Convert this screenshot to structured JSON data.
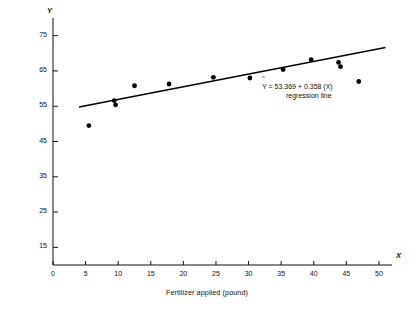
{
  "chart_data": {
    "type": "scatter",
    "title": "",
    "xlabel": "Fertilizer applied (pound)",
    "ylabel": "Yield of Maize (bushels)",
    "x_axis_letter": "X",
    "y_axis_letter": "Y",
    "xlim": [
      0,
      52
    ],
    "ylim": [
      10,
      80
    ],
    "xticks": [
      0,
      5,
      10,
      15,
      20,
      25,
      30,
      35,
      40,
      45,
      50
    ],
    "xtick_labels": [
      "0",
      "5",
      "10",
      "15",
      "20",
      "25",
      "30",
      "35",
      "40",
      "45",
      "50"
    ],
    "yticks": [
      15,
      25,
      35,
      45,
      55,
      65,
      75
    ],
    "ytick_labels": [
      "15",
      "25",
      "35",
      "45",
      "55",
      "65",
      "75"
    ],
    "grid": false,
    "legend": "none",
    "marker_color": "#000000",
    "line_color": "#000000",
    "points": [
      {
        "x": 5.5,
        "y": 49.5
      },
      {
        "x": 9.4,
        "y": 56.6
      },
      {
        "x": 9.6,
        "y": 55.4
      },
      {
        "x": 12.5,
        "y": 60.8
      },
      {
        "x": 17.8,
        "y": 61.3
      },
      {
        "x": 24.6,
        "y": 63.2
      },
      {
        "x": 30.2,
        "y": 63.0
      },
      {
        "x": 35.3,
        "y": 65.4
      },
      {
        "x": 39.6,
        "y": 68.2
      },
      {
        "x": 43.8,
        "y": 67.4
      },
      {
        "x": 44.1,
        "y": 66.2
      },
      {
        "x": 46.9,
        "y": 62.0
      }
    ],
    "regression": {
      "intercept": 53.369,
      "slope": 0.358,
      "x_start": 4.0,
      "x_end": 51.0,
      "equation_hat": "^",
      "equation": "Y  =  53.369  +  0.358 (X)",
      "caption": "regression line"
    }
  }
}
